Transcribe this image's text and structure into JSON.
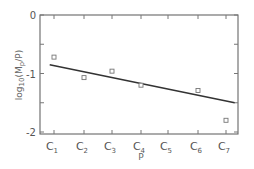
{
  "chart_data": {
    "type": "scatter",
    "title": "",
    "xlabel": "P",
    "ylabel": "log10(Mp/P)",
    "ylabel_parts": {
      "base": "log",
      "sub": "10",
      "paren_open": "(",
      "var": "M",
      "var_sub": "p",
      "rest": "/P)"
    },
    "categories": [
      "C1",
      "C2",
      "C3",
      "C4",
      "C5",
      "C6",
      "C7"
    ],
    "category_labels": [
      {
        "main": "C",
        "sub": "1"
      },
      {
        "main": "C",
        "sub": "2"
      },
      {
        "main": "C",
        "sub": "3"
      },
      {
        "main": "C",
        "sub": "4"
      },
      {
        "main": "C",
        "sub": "5"
      },
      {
        "main": "C",
        "sub": "6"
      },
      {
        "main": "C",
        "sub": "7"
      }
    ],
    "series": [
      {
        "name": "observed",
        "marker": "open-square",
        "points": [
          {
            "x": "C1",
            "y": -0.72
          },
          {
            "x": "C2",
            "y": -1.07
          },
          {
            "x": "C3",
            "y": -0.96
          },
          {
            "x": "C4",
            "y": -1.2
          },
          {
            "x": "C6",
            "y": -1.29
          },
          {
            "x": "C7",
            "y": -1.8
          }
        ]
      },
      {
        "name": "fitted line",
        "style": "solid-line",
        "points": [
          {
            "x": 0.85,
            "y": -0.85
          },
          {
            "x": 7.3,
            "y": -1.5
          }
        ]
      }
    ],
    "ylim": [
      -2,
      0
    ],
    "yticks": [
      0,
      -1,
      -2
    ],
    "yticks_minor": [
      -0.5,
      -1.5
    ],
    "ytick_labels": [
      "0",
      "-1",
      "-2"
    ],
    "grid": false,
    "legend": null
  }
}
